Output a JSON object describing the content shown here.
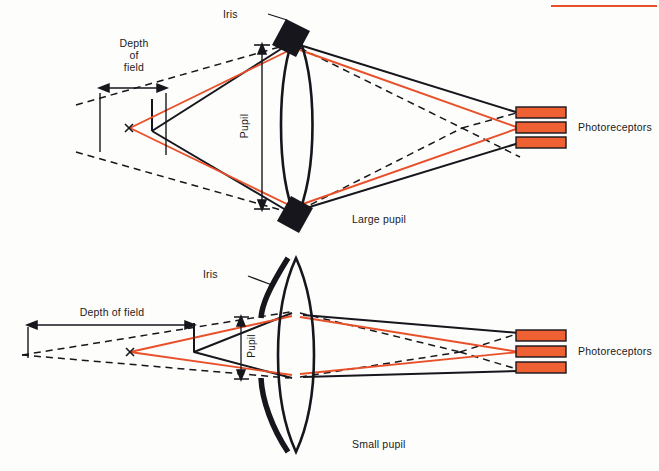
{
  "figure": {
    "background_color": "#fdfdfb",
    "accent_color": "#e8502a",
    "ink_color": "#1b1b1b",
    "width": 659,
    "height": 471
  },
  "top_rule": {
    "name": "orange-horizontal-rule",
    "color": "#e8502a",
    "x": 551,
    "y": 5,
    "width": 106,
    "height": 2
  },
  "panels": [
    {
      "id": "large-pupil",
      "caption": "Large pupil",
      "caption_x": 352,
      "caption_y": 213,
      "labels": {
        "iris": "Iris",
        "pupil": "Pupil",
        "depth_of_field": "Depth\nof\nfield",
        "photoreceptors": "Photoreceptors",
        "object_point": "x"
      },
      "iris_style": "black-rotated-blocks",
      "pupil_aperture_px": 160,
      "depth_of_field_px": 60
    },
    {
      "id": "small-pupil",
      "caption": "Small pupil",
      "caption_x": 352,
      "caption_y": 438,
      "labels": {
        "iris": "Iris",
        "pupil": "Pupil",
        "depth_of_field": "Depth of field",
        "photoreceptors": "Photoreceptors",
        "object_point": "x"
      },
      "iris_style": "black-crescent-arcs",
      "pupil_aperture_px": 46,
      "depth_of_field_px": 212
    }
  ],
  "legend": {
    "solid_black_rays": "marginal rays from in-focus point",
    "red_rays": "rays from object point x",
    "dashed_rays": "rays from out-of-focus limits"
  },
  "chart_data": {
    "type": "diagram",
    "panels": [
      {
        "name": "Large pupil",
        "pupil_diameter_units": 160,
        "depth_of_field_units": 60,
        "relation": "large pupil -> shallow depth of field"
      },
      {
        "name": "Small pupil",
        "pupil_diameter_units": 46,
        "depth_of_field_units": 212,
        "relation": "small pupil -> deep depth of field"
      }
    ],
    "elements": [
      "Iris",
      "Pupil",
      "Depth of field",
      "Photoreceptors",
      "x"
    ]
  }
}
